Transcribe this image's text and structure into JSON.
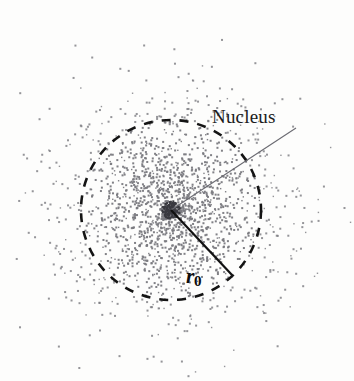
{
  "figure": {
    "width": 354,
    "height": 381,
    "background_color": "#fdfdfc"
  },
  "labels": {
    "nucleus": "Nucleus",
    "radius_symbol": "r",
    "radius_subscript": "0"
  },
  "colors": {
    "dot": "#7a7a80",
    "dashed_circle": "#141414",
    "radius_line": "#111111",
    "leader_line": "#6b6b72",
    "text": "#1b1b1b"
  },
  "chart_data": {
    "type": "scatter",
    "xlabel": "",
    "ylabel": "",
    "grid": false,
    "legend_position": "none",
    "annotations": [
      {
        "name": "nucleus",
        "text": "Nucleus",
        "text_x": 212,
        "text_y": 124,
        "leader_from_x": 171,
        "leader_from_y": 210,
        "leader_to_x": 296,
        "leader_to_y": 128
      },
      {
        "name": "radius",
        "text": "r0",
        "text_x": 186,
        "text_y": 282,
        "leader_from_x": 171,
        "leader_from_y": 210,
        "leader_to_x": 232,
        "leader_to_y": 275
      }
    ],
    "shapes": [
      {
        "name": "nucleus-boundary",
        "type": "circle",
        "cx": 171,
        "cy": 210,
        "r": 90,
        "stroke": "#141414",
        "dash": "9 9",
        "fill": "none"
      }
    ],
    "cloud": {
      "description": "Radially decreasing dot density representing electron probability cloud",
      "center_x": 171,
      "center_y": 210,
      "boundary_radius": 90,
      "max_radius": 215,
      "dot_count": 1850,
      "dot_size_px": 2,
      "density_profile": "gaussian-falloff",
      "dots_inside_boundary_fraction": 0.72
    }
  }
}
